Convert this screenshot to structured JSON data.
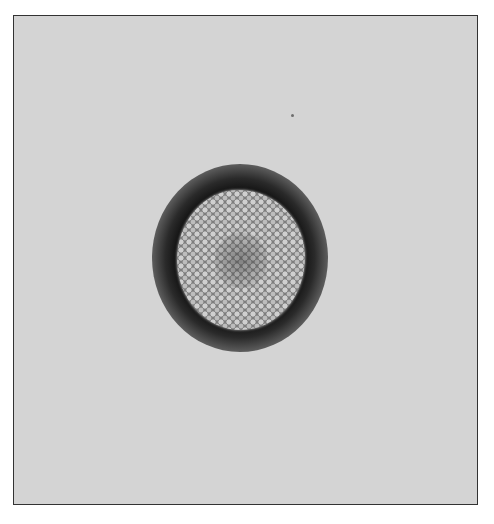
{
  "image": {
    "description": "Grayscale electron micrograph of a single roughly spherical particle with a textured, cobblestone-like surface, surrounded by a dark halo on a light gray background, inside a thin black frame",
    "background_color": "#d4d4d4",
    "halo_color": "#151515",
    "particle_color": "#9e9e9e",
    "frame_color": "#333333"
  }
}
